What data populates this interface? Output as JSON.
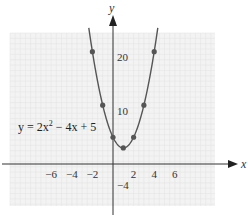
{
  "chart_data": {
    "type": "line",
    "title": "",
    "xlabel": "x",
    "ylabel": "y",
    "equation_label": "y = 2x² − 4x + 5",
    "equation_parts": {
      "lhs": "y = 2x",
      "sup": "2",
      "rhs": " − 4x + 5"
    },
    "x_ticks": [
      -6,
      -4,
      -2,
      2,
      4,
      6
    ],
    "x_tick_labels": [
      "−6",
      "−4",
      "−2",
      "2",
      "4",
      "6"
    ],
    "y_ticks": [
      20,
      10,
      -4
    ],
    "y_tick_labels": [
      "20",
      "10",
      "−4"
    ],
    "xlim": [
      -10,
      10
    ],
    "ylim": [
      -8,
      25
    ],
    "grid": true,
    "legend": "none",
    "series": [
      {
        "name": "y = 2x² − 4x + 5",
        "x": [
          -2,
          -1,
          0,
          1,
          2,
          3,
          4
        ],
        "y": [
          21,
          11,
          5,
          3,
          5,
          11,
          21
        ],
        "marked_points": true
      }
    ]
  },
  "colors": {
    "grid_bg": "#f3f3f3",
    "grid_line": "#e2e2e2",
    "axis": "#333333",
    "curve": "#555555",
    "point": "#555555"
  }
}
